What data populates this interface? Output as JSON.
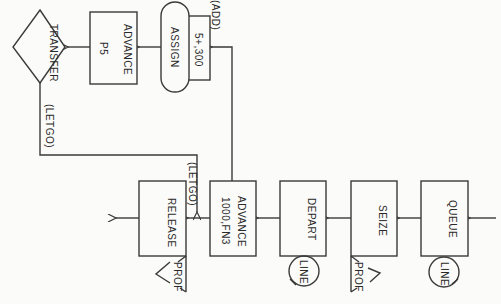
{
  "diagram": {
    "type": "GPSS block diagram",
    "orientation": "rotated 90 degrees clockwise",
    "blocks": {
      "transfer": {
        "label": "TRANSFER",
        "shape": "diamond"
      },
      "advance_p5": {
        "label": "ADVANCE",
        "operand": "P5"
      },
      "assign": {
        "label": "ASSIGN",
        "operand": "5+,300",
        "annotation": "(ADD)"
      },
      "queue": {
        "label": "QUEUE",
        "attached": "LINE"
      },
      "seize": {
        "label": "SEIZE",
        "attached": "PROF"
      },
      "depart": {
        "label": "DEPART",
        "attached": "LINE"
      },
      "advance_fn3": {
        "label": "ADVANCE",
        "operand": "1000,FN3"
      },
      "release": {
        "label": "RELEASE",
        "attached": "PROF"
      }
    },
    "edge_labels": {
      "transfer_out": "(LETGO)",
      "release_in": "(LETGO)"
    }
  },
  "colors": {
    "line": "#3a3a3a",
    "background": "#fbfbf9"
  }
}
